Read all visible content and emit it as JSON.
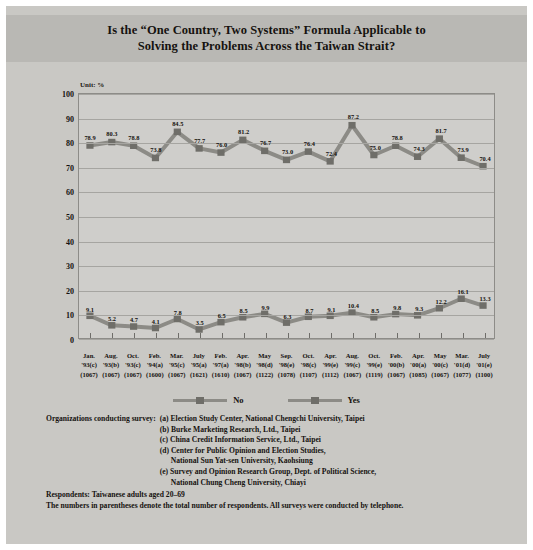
{
  "title": "Is the “One Country, Two Systems” Formula Applicable to Solving the Problems Across the Taiwan Strait?",
  "title_line1": "Is the “One Country, Two Systems” Formula Applicable to",
  "title_line2": "Solving the Problems Across the Taiwan Strait?",
  "unit_label": "Unit: %",
  "colors": {
    "no_series": "#8c8b86",
    "yes_series": "#8c8b86",
    "no_marker": "#6f6e69",
    "yes_marker": "#6f6e69",
    "plot_background": "#cfcecb",
    "panel_background": "#c9c8c4",
    "title_band": "#b9b8b4",
    "text": "#15120f"
  },
  "legend": [
    {
      "label": "No",
      "key": "no"
    },
    {
      "label": "Yes",
      "key": "yes"
    }
  ],
  "chart_data": {
    "type": "line",
    "title": "Is the “One Country, Two Systems” Formula Applicable to Solving the Problems Across the Taiwan Strait?",
    "xlabel": "",
    "ylabel": "Unit: %",
    "ylim": [
      0,
      100
    ],
    "yticks": [
      0,
      10,
      20,
      30,
      40,
      50,
      60,
      70,
      80,
      90,
      100
    ],
    "grid": true,
    "legend_position": "bottom",
    "categories": [
      "Jan. '93(c)",
      "Aug. '93(b)",
      "Oct. '93(c)",
      "Feb. '94(a)",
      "Mar. '95(c)",
      "July '95(a)",
      "Feb. '97(a)",
      "Apr. '98(b)",
      "May '98(d)",
      "Sep. '98(e)",
      "Oct. '98(c)",
      "Apr. '99(e)",
      "Aug. '99(e)",
      "Oct. '99(e)",
      "Feb. '00(b)",
      "Apr. '00(a)",
      "May '00(c)",
      "Mar. '01(d)",
      "July '01(e)"
    ],
    "category_lines": [
      {
        "month": "Jan.",
        "year": "'93(c)",
        "n": "(1067)"
      },
      {
        "month": "Aug.",
        "year": "'93(b)",
        "n": "(1067)"
      },
      {
        "month": "Oct.",
        "year": "'93(c)",
        "n": "(1067)"
      },
      {
        "month": "Feb.",
        "year": "'94(a)",
        "n": "(1600)"
      },
      {
        "month": "Mar.",
        "year": "'95(c)",
        "n": "(1067)"
      },
      {
        "month": "July",
        "year": "'95(a)",
        "n": "(1621)"
      },
      {
        "month": "Feb.",
        "year": "'97(a)",
        "n": "(1610)"
      },
      {
        "month": "Apr.",
        "year": "'98(b)",
        "n": "(1067)"
      },
      {
        "month": "May",
        "year": "'98(d)",
        "n": "(1122)"
      },
      {
        "month": "Sep.",
        "year": "'98(e)",
        "n": "(1078)"
      },
      {
        "month": "Oct.",
        "year": "'98(c)",
        "n": "(1107)"
      },
      {
        "month": "Apr.",
        "year": "'99(e)",
        "n": "(1112)"
      },
      {
        "month": "Aug.",
        "year": "'99(c)",
        "n": "(1067)"
      },
      {
        "month": "Oct.",
        "year": "'99(e)",
        "n": "(1119)"
      },
      {
        "month": "Feb.",
        "year": "'00(b)",
        "n": "(1067)"
      },
      {
        "month": "Apr.",
        "year": "'00(a)",
        "n": "(1085)"
      },
      {
        "month": "May",
        "year": "'00(c)",
        "n": "(1067)"
      },
      {
        "month": "Mar.",
        "year": "'01(d)",
        "n": "(1077)"
      },
      {
        "month": "July",
        "year": "'01(e)",
        "n": "(1100)"
      }
    ],
    "series": [
      {
        "name": "No",
        "values": [
          78.9,
          80.3,
          78.8,
          73.8,
          84.5,
          77.7,
          76.0,
          81.2,
          76.7,
          73.0,
          76.4,
          72.4,
          87.2,
          75.0,
          78.8,
          74.3,
          81.7,
          73.9,
          70.4
        ]
      },
      {
        "name": "Yes",
        "values": [
          9.1,
          5.2,
          4.7,
          4.1,
          7.8,
          3.5,
          6.5,
          8.5,
          9.9,
          6.3,
          8.7,
          9.1,
          10.4,
          8.5,
          9.8,
          9.3,
          12.2,
          16.1,
          13.3
        ]
      }
    ]
  },
  "notes": {
    "orgs_heading": "Organizations conducting survey:",
    "orgs": [
      {
        "marker": "(a)",
        "text": "Election Study Center, National Chengchi University, Taipei",
        "cont": ""
      },
      {
        "marker": "(b)",
        "text": "Burke Marketing Research, Ltd., Taipei",
        "cont": ""
      },
      {
        "marker": "(c)",
        "text": "China Credit Information Service, Ltd., Taipei",
        "cont": ""
      },
      {
        "marker": "(d)",
        "text": "Center for Public Opinion and Election Studies,",
        "cont": "National Sun Yat-sen University, Kaohsiung"
      },
      {
        "marker": "(e)",
        "text": "Survey and Opinion Research Group, Dept. of Political Science,",
        "cont": "National Chung Cheng University, Chiayi"
      }
    ],
    "respondents": "Respondents: Taiwanese adults aged 20–69",
    "parentheses": "The numbers in parentheses denote the total number of respondents. All surveys were conducted by telephone."
  }
}
